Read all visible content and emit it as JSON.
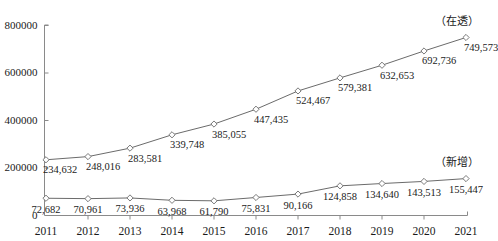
{
  "chart_data": {
    "type": "line",
    "title": "",
    "subtitle": "",
    "xlabel": "",
    "ylabel": "",
    "grid": false,
    "legend_position": "inline-right",
    "categories": [
      "2011",
      "2012",
      "2013",
      "2014",
      "2015",
      "2016",
      "2017",
      "2018",
      "2019",
      "2020",
      "2021"
    ],
    "ylim": [
      0,
      800000
    ],
    "yticks": [
      0,
      200000,
      400000,
      600000,
      800000
    ],
    "ytick_labels": [
      "0",
      "200000",
      "400000",
      "600000",
      "800000"
    ],
    "series": [
      {
        "name": "在透",
        "label": "（在透）",
        "values": [
          234632,
          248016,
          283581,
          339748,
          385055,
          447435,
          524467,
          579381,
          632653,
          692736,
          749573
        ],
        "value_labels": [
          "234,632",
          "248,016",
          "283,581",
          "339,748",
          "385,055",
          "447,435",
          "524,467",
          "579,381",
          "632,653",
          "692,736",
          "749,573"
        ],
        "color": "#6b6b6b",
        "marker": "diamond-open"
      },
      {
        "name": "新增",
        "label": "（新增）",
        "values": [
          72682,
          70961,
          73936,
          63968,
          61790,
          75831,
          90166,
          124858,
          134640,
          143513,
          155447
        ],
        "value_labels": [
          "72,682",
          "70,961",
          "73,936",
          "63,968",
          "61,790",
          "75,831",
          "90,166",
          "124,858",
          "134,640",
          "143,513",
          "155,447"
        ],
        "color": "#6b6b6b",
        "marker": "diamond-open"
      }
    ]
  },
  "axis": {
    "line_color": "#8a8a8a",
    "tick_color": "#8a8a8a"
  }
}
